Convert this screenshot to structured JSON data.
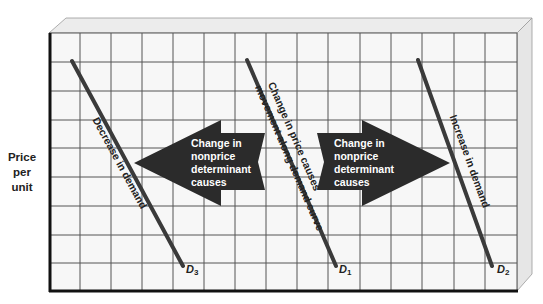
{
  "diagram": {
    "type": "demand-curve-shifts",
    "y_axis_label": [
      "Price",
      "per",
      "unit"
    ],
    "colors": {
      "background": "#ffffff",
      "panel": "#f7f7f7",
      "bevel": "#e8e8e8",
      "grid": "#555555",
      "frame": "#111111",
      "curve": "#3a3a3a",
      "arrow": "#2b2b2b",
      "arrow_text": "#ffffff"
    },
    "grid": {
      "columns": 15,
      "rows": 9
    },
    "curves": [
      {
        "id": "D3",
        "label": "D",
        "subscript": "3",
        "annotation": "Decrease in demand"
      },
      {
        "id": "D1",
        "label": "D",
        "subscript": "1",
        "annotation_line1": "Change in price causes",
        "annotation_line2": "movement along demand curve"
      },
      {
        "id": "D2",
        "label": "D",
        "subscript": "2",
        "annotation": "Increase in demand"
      }
    ],
    "arrows": [
      {
        "direction": "left",
        "lines": [
          "Change in",
          "nonprice",
          "determinant",
          "causes"
        ]
      },
      {
        "direction": "right",
        "lines": [
          "Change in",
          "nonprice",
          "determinant",
          "causes"
        ]
      }
    ]
  }
}
